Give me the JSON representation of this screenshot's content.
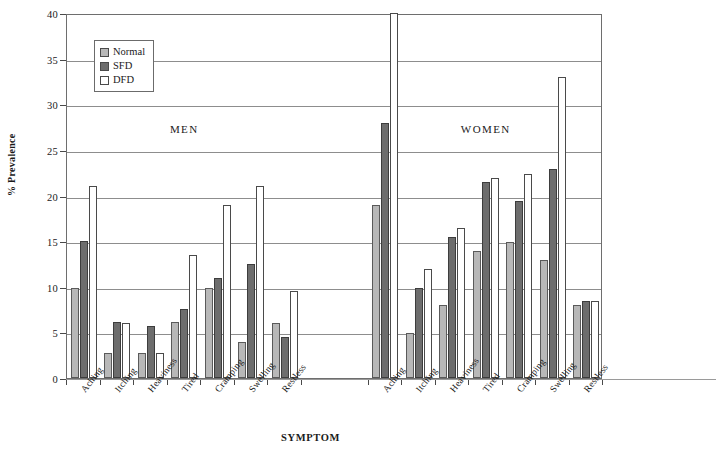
{
  "chart_data": {
    "type": "bar",
    "title": "",
    "xlabel": "SYMPTOM",
    "ylabel": "% Prevalence",
    "ylim": [
      0,
      40
    ],
    "ytick_step": 5,
    "yticks": [
      0,
      5,
      10,
      15,
      20,
      25,
      30,
      35,
      40
    ],
    "grid": true,
    "legend_position": "top-left",
    "legend": [
      "Normal",
      "SFD",
      "DFD"
    ],
    "panels": [
      {
        "name": "MEN",
        "categories": [
          "Aching",
          "Itching",
          "Heaviness",
          "Tired",
          "Cramping",
          "Swelling",
          "Restless"
        ],
        "series": [
          {
            "name": "Normal",
            "values": [
              9.9,
              2.7,
              2.7,
              6.1,
              9.9,
              3.9,
              6.0
            ]
          },
          {
            "name": "SFD",
            "values": [
              15.0,
              6.1,
              5.7,
              7.6,
              11.0,
              12.5,
              4.5
            ]
          },
          {
            "name": "DFD",
            "values": [
              21.0,
              6.0,
              2.7,
              13.5,
              19.0,
              21.0,
              9.5
            ]
          }
        ]
      },
      {
        "name": "WOMEN",
        "categories": [
          "Aching",
          "Itching",
          "Heaviness",
          "Tired",
          "Cramping",
          "Swelling",
          "Restless"
        ],
        "series": [
          {
            "name": "Normal",
            "values": [
              19.0,
              4.9,
              8.0,
              13.9,
              14.9,
              12.9,
              8.0
            ]
          },
          {
            "name": "SFD",
            "values": [
              27.9,
              9.9,
              15.4,
              21.5,
              19.4,
              22.9,
              8.4
            ]
          },
          {
            "name": "DFD",
            "values": [
              41.5,
              11.9,
              16.4,
              21.9,
              22.4,
              33.0,
              8.4
            ]
          }
        ]
      }
    ],
    "colors": {
      "normal": "#b8b8b8",
      "sfd": "#6d6d6d",
      "dfd": "#ffffff",
      "outline": "#4a4a4a",
      "grid": "#8d8d8d"
    }
  }
}
